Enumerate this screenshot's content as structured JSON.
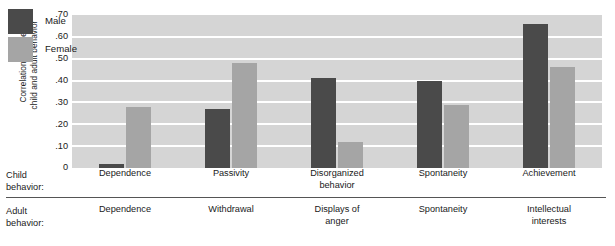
{
  "chart_data": {
    "type": "bar",
    "title": "",
    "xlabel": "",
    "ylabel": "Correlation between\nchild and adult behavior",
    "ylim": [
      0,
      0.7
    ],
    "ytick_labels": [
      ".70",
      ".60",
      ".50",
      ".40",
      ".30",
      ".20",
      ".10",
      "0"
    ],
    "ytick_values": [
      0.7,
      0.6,
      0.5,
      0.4,
      0.3,
      0.2,
      0.1,
      0
    ],
    "grid": true,
    "legend_position": "top-left",
    "categories": [
      "Dependence",
      "Passivity",
      "Disorganized\nbehavior",
      "Spontaneity",
      "Achievement"
    ],
    "adult_categories": [
      "Dependence",
      "Withdrawal",
      "Displays of\nanger",
      "Spontaneity",
      "Intellectual\ninterests"
    ],
    "series": [
      {
        "name": "Male",
        "color": "#4a4a4a",
        "values": [
          0.02,
          0.27,
          0.41,
          0.4,
          0.66
        ]
      },
      {
        "name": "Female",
        "color": "#a5a5a5",
        "values": [
          0.28,
          0.48,
          0.12,
          0.29,
          0.46
        ]
      }
    ]
  },
  "axis_rows": {
    "child_label": "Child\nbehavior:",
    "adult_label": "Adult\nbehavior:"
  },
  "colors": {
    "plot_background": "#d5d5d5",
    "gridline": "#ffffff",
    "male": "#4a4a4a",
    "female": "#a5a5a5",
    "divider": "#555555"
  }
}
